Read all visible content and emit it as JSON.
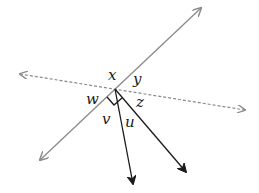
{
  "diagram": {
    "type": "angle-diagram",
    "intersection_point": [
      115,
      89
    ],
    "colors": {
      "solid_line": "#8a8a8a",
      "dashed_line": "#8a8a8a",
      "rays": "#1a1a1a",
      "right_angle_mark": "#1a1a1a",
      "labels": "#1a1a1a"
    },
    "lines": [
      {
        "id": "solid-line",
        "style": "solid",
        "from": [
          40,
          160
        ],
        "to": [
          201,
          8
        ],
        "arrows": "both"
      },
      {
        "id": "dashed-line",
        "style": "dashed",
        "from": [
          20,
          74
        ],
        "to": [
          245,
          110
        ],
        "arrows": "both"
      }
    ],
    "rays": [
      {
        "id": "ray-u",
        "from": [
          115,
          89
        ],
        "to": [
          133,
          185
        ]
      },
      {
        "id": "ray-z",
        "from": [
          115,
          89
        ],
        "to": [
          187,
          173
        ]
      }
    ],
    "right_angle_mark": {
      "between": [
        "solid-line-lower",
        "ray-u"
      ]
    },
    "labels": {
      "x": "x",
      "y": "y",
      "w": "w",
      "z": "z",
      "v": "v",
      "u": "u"
    }
  }
}
